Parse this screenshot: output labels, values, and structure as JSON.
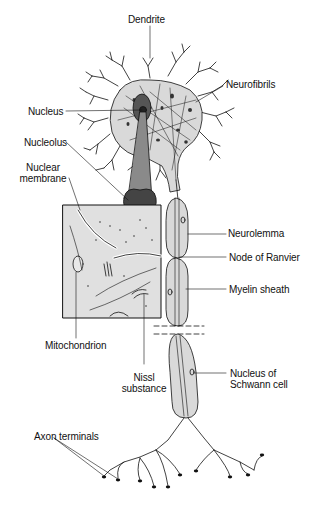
{
  "figure": {
    "colors": {
      "ink": "#111111",
      "cell_fill": "#d9d9d9",
      "inset_fill": "#e0e0e0",
      "nucleus_fill": "#555555",
      "stalk_fill": "#8a8a8a",
      "background": "#ffffff"
    },
    "labels": {
      "dendrite": "Dendrite",
      "neurofibrils": "Neurofibrils",
      "nucleus": "Nucleus",
      "nucleolus": "Nucleolus",
      "nuclear_membrane_line1": "Nuclear",
      "nuclear_membrane_line2": "membrane",
      "neurolemma": "Neurolemma",
      "node_of_ranvier": "Node of Ranvier",
      "myelin_sheath": "Myelin sheath",
      "mitochondrion": "Mitochondrion",
      "nissl_line1": "Nissl",
      "nissl_line2": "substance",
      "schwann_line1": "Nucleus of",
      "schwann_line2": "Schwann cell",
      "axon_terminals": "Axon terminals"
    }
  }
}
